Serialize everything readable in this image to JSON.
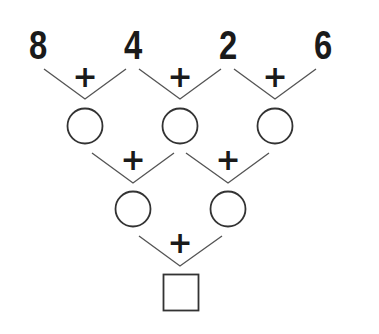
{
  "puzzle": {
    "title": "Addition pyramid",
    "top_numbers": [
      "8",
      "4",
      "2",
      "6"
    ],
    "operator": "+",
    "row1_operators": [
      "+",
      "+",
      "+"
    ],
    "row2_operators": [
      "+",
      "+"
    ],
    "row3_operators": [
      "+"
    ],
    "row1_blanks": [
      "",
      "",
      ""
    ],
    "row2_blanks": [
      "",
      ""
    ],
    "answer_box": ""
  },
  "colors": {
    "background": "#ffffff",
    "ink": "#1a1a1a",
    "lines": "#555555"
  }
}
